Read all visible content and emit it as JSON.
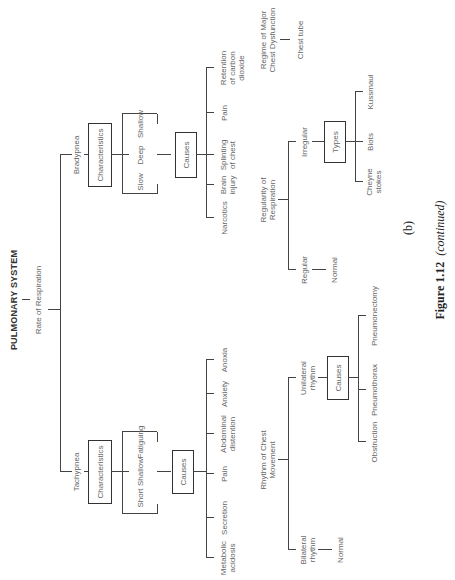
{
  "title": "PULMONARY SYSTEM",
  "root": "Rate of Respiration",
  "bradypnea": {
    "label": "Bradypnea",
    "characteristics_box": "Characteristics",
    "characteristics": [
      "Slow",
      "Deep",
      "Shallow"
    ],
    "causes_box": "Causes",
    "causes": [
      "Narcotics",
      "Brain\ninjury",
      "Splinting\nof chest",
      "Pain",
      "Retention\nof carbon\ndioxide"
    ]
  },
  "tachypnea": {
    "label": "Tachypnea",
    "characteristics_box": "Characteristics",
    "characteristics": [
      "Short",
      "Shallow",
      "Fatiguing"
    ],
    "causes_box": "Causes",
    "causes": [
      "Metabolic\nacidosis",
      "Secretion",
      "Pain",
      "Abdominal\ndistention",
      "Anxiety",
      "Anoxia"
    ]
  },
  "regime": {
    "label": "Regime of Major\nChest Dysfunction",
    "child": "Chest tube"
  },
  "regularity": {
    "label": "Regularity of\nRespiration",
    "regular": "Regular",
    "regular_child": "Normal",
    "irregular": "Irregular",
    "types_box": "Types",
    "types": [
      "Cheyne\nstokes",
      "Biots",
      "Kussmaul"
    ]
  },
  "rhythm": {
    "label": "Rhythm of Chest\nMovement",
    "bilateral": "Bilateral\nrhythm",
    "bilateral_child": "Normal",
    "unilateral": "Unilateral\nrhythm",
    "causes_box": "Causes",
    "causes": [
      "Obstruction",
      "Pneumothorax",
      "Pneumonectomy"
    ]
  },
  "sublabel": "(b)",
  "caption": {
    "figure": "Figure 1.12",
    "note": "(continued)"
  }
}
